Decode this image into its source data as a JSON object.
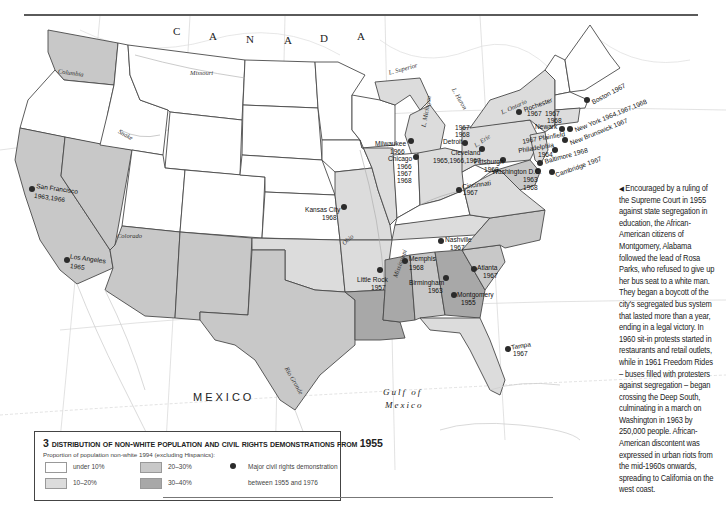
{
  "map": {
    "country_labels": {
      "canada": [
        "C",
        "A",
        "N",
        "A",
        "D",
        "A"
      ],
      "mexico": "MEXICO",
      "gulf_line1": "Gulf of",
      "gulf_line2": "Mexico"
    },
    "water_labels": {
      "l_superior": "L. Superior",
      "l_michigan": "L. Michigan",
      "l_huron": "L. Huron",
      "l_ontario": "L. Ontario",
      "l_erie": "L. Erie"
    },
    "rivers": {
      "columbia": "Columbia",
      "missouri": "Missouri",
      "snake": "Snake",
      "colorado": "Colorado",
      "ohio": "Ohio",
      "mississippi": "Mississippi",
      "rio_grande": "Rio Grande"
    },
    "graticule": {
      "lon_120": "120°",
      "lon_110": "110°",
      "lon_100": "100°",
      "lon_90": "90°",
      "lon_80": "80°",
      "lat_40": "40°",
      "lat_30": "30°"
    },
    "colors": {
      "under_10": "#ffffff",
      "p10_20": "#dcdcdc",
      "p20_30": "#c8c8c8",
      "p30_40": "#a8a8a8",
      "border": "#4a4a4a",
      "water_line": "#cfcfcf"
    },
    "demonstrations": [
      {
        "id": "boston",
        "city": "Boston",
        "years": "1967"
      },
      {
        "id": "rochester",
        "city": "Rochester",
        "years": "1967"
      },
      {
        "id": "newark",
        "city": "Newark",
        "years": "1967 1968"
      },
      {
        "id": "new-york",
        "city": "New York",
        "years": "1964,1967,1968"
      },
      {
        "id": "plainfield",
        "city": "Plainfield",
        "years": "1967"
      },
      {
        "id": "new-brunswick",
        "city": "New Brunswick",
        "years": "1967"
      },
      {
        "id": "philadelphia",
        "city": "Philadelphia",
        "years": "1964"
      },
      {
        "id": "baltimore",
        "city": "Baltimore",
        "years": "1968"
      },
      {
        "id": "cambridge",
        "city": "Cambridge",
        "years": "1967"
      },
      {
        "id": "washington",
        "city": "Washington D.C.",
        "years": "1963 1968"
      },
      {
        "id": "pittsburgh",
        "city": "Pittsburgh",
        "years": "1968"
      },
      {
        "id": "cleveland",
        "city": "Cleveland",
        "years": "1965,1966,1967"
      },
      {
        "id": "detroit",
        "city": "Detroit",
        "years": "1967 1968"
      },
      {
        "id": "milwaukee",
        "city": "Milwaukee",
        "years": "1966"
      },
      {
        "id": "chicago",
        "city": "Chicago",
        "years": "1966 1967 1968"
      },
      {
        "id": "cincinnati",
        "city": "Cincinnati",
        "years": "1967"
      },
      {
        "id": "kansas-city",
        "city": "Kansas City",
        "years": "1968"
      },
      {
        "id": "nashville",
        "city": "Nashville",
        "years": "1967"
      },
      {
        "id": "memphis",
        "city": "Memphis",
        "years": "1968"
      },
      {
        "id": "little-rock",
        "city": "Little Rock",
        "years": "1957"
      },
      {
        "id": "birmingham",
        "city": "Birmingham",
        "years": "1963"
      },
      {
        "id": "atlanta",
        "city": "Atlanta",
        "years": "1967"
      },
      {
        "id": "montgomery",
        "city": "Montgomery",
        "years": "1955"
      },
      {
        "id": "tampa",
        "city": "Tampa",
        "years": "1967"
      },
      {
        "id": "san-francisco",
        "city": "San Francisco",
        "years": "1963,1966"
      },
      {
        "id": "los-angeles",
        "city": "Los Angeles",
        "years": "1965"
      }
    ]
  },
  "labels": {
    "boston": "Boston 1967",
    "rochester_1": "Rochester",
    "rochester_2": "1967",
    "newark_y1": "1967",
    "newark_y2": "1968",
    "newark": "Newark",
    "new_york": "New York 1964,1967,1968",
    "plainfield": "1967 Plainfield",
    "new_brunswick": "New Brunswick 1967",
    "philadelphia_1": "Philadelphia",
    "philadelphia_2": "1964",
    "baltimore": "Baltimore 1968",
    "cambridge": "Cambridge 1967",
    "washington_1": "Washington D.C.",
    "washington_2": "1963",
    "washington_3": "1968",
    "pittsburgh_1": "Pittsburgh",
    "pittsburgh_2": "1968",
    "cleveland_1": "Cleveland",
    "cleveland_2": "1965,1966,1967",
    "detroit_1": "1967",
    "detroit_2": "1968",
    "detroit_3": "Detroit",
    "milwaukee_1": "Milwaukee",
    "milwaukee_2": "1966",
    "chicago_1": "Chicago",
    "chicago_2": "1966",
    "chicago_3": "1967",
    "chicago_4": "1968",
    "cincinnati_1": "Cincinnati",
    "cincinnati_2": "1967",
    "kansas_city_1": "Kansas City",
    "kansas_city_2": "1968",
    "nashville_1": "Nashville",
    "nashville_2": "1967",
    "memphis_1": "Memphis",
    "memphis_2": "1968",
    "little_rock_1": "Little Rock",
    "little_rock_2": "1957",
    "birmingham_1": "Birmingham",
    "birmingham_2": "1963",
    "atlanta_1": "Atlanta",
    "atlanta_2": "1967",
    "montgomery_1": "Montgomery",
    "montgomery_2": "1955",
    "tampa_1": "Tampa",
    "tampa_2": "1967",
    "san_francisco_1": "San Francisco",
    "san_francisco_2": "1963,1966",
    "los_angeles_1": "Los Angeles",
    "los_angeles_2": "1965"
  },
  "caption": {
    "arrow": "◀",
    "text": "Encouraged by a ruling of the Supreme Court in 1955 against state segregation in education, the African-American citizens of Montgomery, Alabama followed the lead of Rosa Parks, who refused to give up her bus seat to a white man. They began a boycott of the city's segregated bus system that lasted more than a year, ending in a legal victory. In 1960 sit-in protests started in restaurants and retail outlets, while in 1961 Freedom Rides – buses filled with protesters against segregation – began crossing the Deep South, culminating in a march on Washington in 1963 by 250,000 people. African-American discontent was expressed in urban riots from the mid-1960s onwards, spreading to California on the west coast."
  },
  "legend": {
    "number": "3",
    "title_main": "Distribution of non-white population and civil rights demonstrations from",
    "title_year": "1955",
    "subtitle": "Proportion of population non-white 1994 (excluding Hispanics):",
    "items": [
      {
        "label": "under 10%",
        "color": "#ffffff"
      },
      {
        "label": "10–20%",
        "color": "#dcdcdc"
      },
      {
        "label": "20–30%",
        "color": "#c8c8c8"
      },
      {
        "label": "30–40%",
        "color": "#a8a8a8"
      }
    ],
    "symbol_label_1": "Major civil rights demonstration",
    "symbol_label_2": "between 1955 and 1976"
  }
}
